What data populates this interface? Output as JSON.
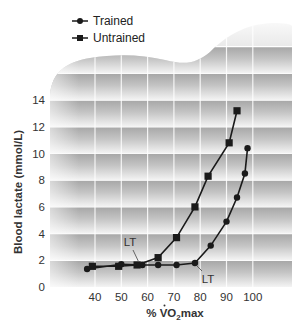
{
  "chart_data": {
    "type": "line",
    "title": "",
    "xlabel": "% VO2max",
    "xlabel_parts": {
      "prefix": "% ",
      "main": "V",
      "dot": "˙",
      "after": "O",
      "sub": "2",
      "suffix": "max"
    },
    "ylabel": "Blood lactate (mmol/L)",
    "xlim": [
      30,
      112
    ],
    "ylim": [
      0,
      18
    ],
    "x_ticks": [
      40,
      50,
      60,
      70,
      80,
      90,
      100
    ],
    "y_ticks": [
      0,
      2,
      4,
      6,
      8,
      10,
      12,
      14
    ],
    "grid": true,
    "legend_position": "top-left",
    "series": [
      {
        "name": "Trained",
        "marker": "circle",
        "x": [
          37,
          50,
          58,
          64,
          71,
          78,
          84,
          90,
          94,
          97,
          98
        ],
        "y": [
          1.35,
          1.7,
          1.65,
          1.65,
          1.65,
          1.8,
          3.1,
          4.9,
          6.7,
          8.5,
          10.4
        ]
      },
      {
        "name": "Untrained",
        "marker": "square",
        "x": [
          39,
          49,
          56,
          64,
          71,
          78,
          83,
          91,
          94
        ],
        "y": [
          1.55,
          1.55,
          1.65,
          2.2,
          3.7,
          6.0,
          8.3,
          10.8,
          13.2
        ]
      }
    ],
    "annotations": [
      {
        "text": "LT",
        "series": "Untrained",
        "at_x": 57,
        "at_y": 1.65
      },
      {
        "text": "LT",
        "series": "Trained",
        "at_x": 78,
        "at_y": 1.8
      }
    ]
  },
  "legend": {
    "items": [
      {
        "label": "Trained",
        "marker": "circle"
      },
      {
        "label": "Untrained",
        "marker": "square"
      }
    ]
  },
  "colors": {
    "line": "#1a1a1a",
    "band_dark": "#a8a8a8",
    "band_light": "#f2f2f2",
    "gridline": "#ffffff",
    "text": "#333333"
  }
}
